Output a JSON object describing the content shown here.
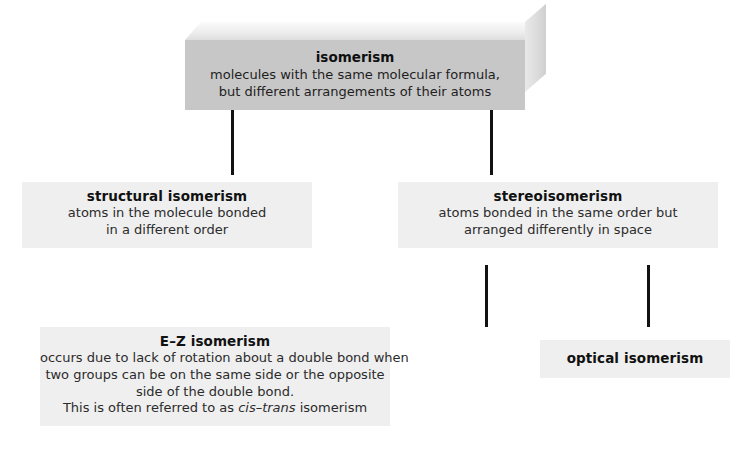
{
  "diagram": {
    "type": "hierarchy-flowchart",
    "root": {
      "id": "isomerism",
      "title": "isomerism",
      "description_lines": [
        "molecules with the same molecular formula,",
        "but different arrangements of their atoms"
      ],
      "style": "3d-slab",
      "fill_color": "#c7c7c7"
    },
    "level2": [
      {
        "id": "structural-isomerism",
        "title": "structural isomerism",
        "description_lines": [
          "atoms in the molecule bonded",
          "in a different order"
        ],
        "fill_color": "#efefef"
      },
      {
        "id": "stereoisomerism",
        "title": "stereoisomerism",
        "description_lines": [
          "atoms bonded in the same order but",
          "arranged differently in space"
        ],
        "fill_color": "#efefef"
      }
    ],
    "level3": [
      {
        "id": "ez-isomerism",
        "title": "E–Z isomerism",
        "description_lines": [
          "occurs due to lack of rotation about a double bond when",
          "two groups can be on the same side or the opposite",
          "side of the double bond."
        ],
        "final_line": {
          "before": "This is often referred to as ",
          "italic": "cis–trans",
          "after": " isomerism"
        },
        "fill_color": "#efefef"
      },
      {
        "id": "optical-isomerism",
        "title": "optical isomerism",
        "description_lines": [],
        "fill_color": "#efefef"
      }
    ],
    "connectors": [
      {
        "id": "root-to-structural",
        "color": "#121212"
      },
      {
        "id": "root-to-stereo",
        "color": "#121212"
      },
      {
        "id": "stereo-to-ez",
        "color": "#121212"
      },
      {
        "id": "stereo-to-optical",
        "color": "#121212"
      }
    ]
  }
}
